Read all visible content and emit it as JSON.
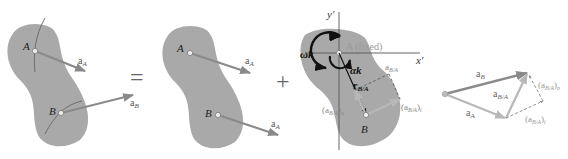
{
  "colors": {
    "body_fill": "#a9a9a9",
    "arrow_gray": "#8a8a8a",
    "arrow_light": "#b8b8b8",
    "text_dark": "#333333",
    "text_light": "#9a9a9a",
    "axis": "#555555",
    "black": "#111111"
  },
  "panels": [
    {
      "id": "total-motion",
      "points": {
        "A": "A",
        "B": "B"
      },
      "vectors": {
        "aA": "a",
        "aA_sub": "A",
        "aB": "a",
        "aB_sub": "B"
      }
    },
    {
      "id": "translation",
      "points": {
        "A": "A",
        "B": "B"
      },
      "vectors": {
        "aA1": "a",
        "aA1_sub": "A",
        "aA2": "a",
        "aA2_sub": "A"
      }
    },
    {
      "id": "rotation-about-A",
      "axes": {
        "x": "x′",
        "y": "y′"
      },
      "point_A": "A (fixed)",
      "point_B": "B",
      "omega": "ωk",
      "alpha": "αk",
      "r": "r",
      "r_sub": "B/A",
      "aBA": "a",
      "aBA_sub": "B/A",
      "aBA_n": "(a",
      "aBA_n_sub": "B/A",
      "aBA_n_tail": ")",
      "aBA_n_idx": "n",
      "aBA_t": "(a",
      "aBA_t_sub": "B/A",
      "aBA_t_tail": ")",
      "aBA_t_idx": "t"
    },
    {
      "id": "vector-triangle",
      "aB": "a",
      "aB_sub": "B",
      "aA": "a",
      "aA_sub": "A",
      "aBA": "a",
      "aBA_sub": "B/A",
      "aBA_n": "(a",
      "aBA_n_sub": "B/A",
      "aBA_n_tail": ")",
      "aBA_n_idx": "n",
      "aBA_t": "(a",
      "aBA_t_sub": "B/A",
      "aBA_t_tail": ")",
      "aBA_t_idx": "t"
    }
  ],
  "operators": {
    "equals": "=",
    "plus": "+"
  }
}
